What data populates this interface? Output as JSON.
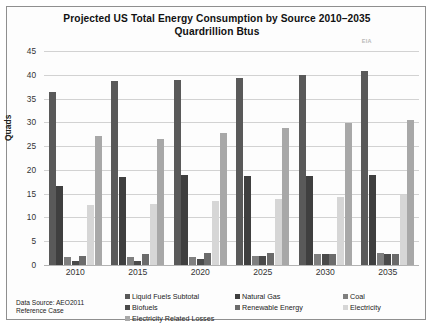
{
  "chart_data": {
    "type": "bar",
    "title": "Projected US Total Energy Consumption by Source 2010–2035",
    "subtitle": "Quardrillion Btus",
    "watermark": "EIA",
    "xlabel": "",
    "ylabel": "Quads",
    "ylim": [
      0,
      45
    ],
    "ytick_step": 5,
    "yticks": [
      0,
      5,
      10,
      15,
      20,
      25,
      30,
      35,
      40,
      45
    ],
    "grid": true,
    "legend_position": "bottom",
    "categories": [
      "2010",
      "2015",
      "2020",
      "2025",
      "2030",
      "2035"
    ],
    "series": [
      {
        "name": "Liquid Fuels Subtotal",
        "color": "#595959",
        "values": [
          36.4,
          38.7,
          38.9,
          39.3,
          39.9,
          40.9
        ]
      },
      {
        "name": "Natural Gas",
        "color": "#3f3f3f",
        "values": [
          16.7,
          18.5,
          18.9,
          18.8,
          18.8,
          19.0
        ]
      },
      {
        "name": "Coal",
        "color": "#7f7f7f",
        "values": [
          1.6,
          1.7,
          1.7,
          2.0,
          2.3,
          2.5
        ]
      },
      {
        "name": "Biofuels",
        "color": "#4a4a4a",
        "values": [
          0.8,
          0.9,
          1.2,
          1.9,
          2.3,
          2.4
        ]
      },
      {
        "name": "Renewable Energy",
        "color": "#6b6b6b",
        "values": [
          2.0,
          2.3,
          2.5,
          2.5,
          2.4,
          2.4
        ]
      },
      {
        "name": "Electricity",
        "color": "#d6d6d6",
        "values": [
          12.6,
          12.9,
          13.4,
          13.9,
          14.4,
          14.8
        ]
      },
      {
        "name": "Electricity Related Losses",
        "color": "#a8a8a8",
        "values": [
          27.2,
          26.5,
          27.8,
          28.8,
          29.8,
          30.5
        ]
      }
    ],
    "source_note_line1": "Data Source: AEO2011",
    "source_note_line2": "Reference Case"
  }
}
